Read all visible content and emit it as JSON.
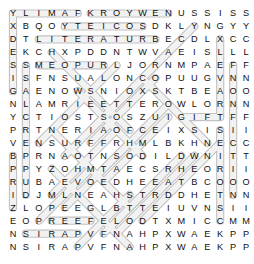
{
  "puzzle": {
    "type": "word-search",
    "rows": 19,
    "cols": 19,
    "cell_size": 12.95,
    "origin_x": 6.5,
    "origin_y": 7.0,
    "grid": [
      [
        "Y",
        "L",
        "I",
        "M",
        "A",
        "F",
        "K",
        "R",
        "O",
        "Y",
        "W",
        "E",
        "N",
        "U",
        "S",
        "S",
        "I",
        "S",
        "S"
      ],
      [
        "X",
        "B",
        "Q",
        "O",
        "Y",
        "T",
        "E",
        "I",
        "C",
        "O",
        "S",
        "D",
        "K",
        "L",
        "Y",
        "N",
        "G",
        "Y",
        "Y"
      ],
      [
        "D",
        "T",
        "L",
        "I",
        "T",
        "E",
        "R",
        "A",
        "T",
        "U",
        "R",
        "B",
        "E",
        "C",
        "D",
        "L",
        "X",
        "C",
        "C"
      ],
      [
        "E",
        "K",
        "C",
        "H",
        "X",
        "P",
        "D",
        "D",
        "N",
        "T",
        "W",
        "V",
        "A",
        "E",
        "I",
        "S",
        "L",
        "L",
        "L"
      ],
      [
        "S",
        "S",
        "M",
        "E",
        "O",
        "P",
        "U",
        "R",
        "L",
        "J",
        "O",
        "R",
        "N",
        "M",
        "P",
        "A",
        "E",
        "F",
        "F"
      ],
      [
        "I",
        "S",
        "F",
        "N",
        "S",
        "U",
        "A",
        "L",
        "O",
        "N",
        "C",
        "O",
        "P",
        "U",
        "U",
        "G",
        "V",
        "N",
        "N"
      ],
      [
        "G",
        "A",
        "E",
        "N",
        "O",
        "W",
        "S",
        "N",
        "I",
        "O",
        "X",
        "S",
        "K",
        "T",
        "B",
        "E",
        "A",
        "O",
        "O"
      ],
      [
        "N",
        "L",
        "A",
        "M",
        "R",
        "I",
        "E",
        "E",
        "T",
        "T",
        "E",
        "R",
        "O",
        "W",
        "L",
        "O",
        "R",
        "N",
        "N"
      ],
      [
        "Y",
        "C",
        "T",
        "I",
        "O",
        "S",
        "T",
        "S",
        "O",
        "S",
        "Z",
        "U",
        "I",
        "G",
        "I",
        "F",
        "T",
        "F",
        "F"
      ],
      [
        "P",
        "R",
        "T",
        "N",
        "E",
        "R",
        "I",
        "A",
        "O",
        "F",
        "C",
        "E",
        "I",
        "X",
        "S",
        "I",
        "S",
        "I",
        "I"
      ],
      [
        "V",
        "E",
        "N",
        "S",
        "U",
        "R",
        "F",
        "F",
        "R",
        "H",
        "M",
        "L",
        "B",
        "K",
        "H",
        "N",
        "E",
        "C",
        "C"
      ],
      [
        "B",
        "P",
        "R",
        "N",
        "A",
        "O",
        "T",
        "N",
        "S",
        "O",
        "D",
        "I",
        "L",
        "D",
        "W",
        "N",
        "I",
        "T",
        "T"
      ],
      [
        "P",
        "P",
        "Y",
        "Z",
        "O",
        "H",
        "M",
        "T",
        "A",
        "E",
        "C",
        "S",
        "R",
        "H",
        "E",
        "O",
        "R",
        "I",
        "I"
      ],
      [
        "R",
        "U",
        "B",
        "A",
        "E",
        "V",
        "O",
        "E",
        "D",
        "H",
        "E",
        "E",
        "A",
        "T",
        "B",
        "C",
        "O",
        "O",
        "O"
      ],
      [
        "I",
        "D",
        "J",
        "M",
        "L",
        "N",
        "E",
        "A",
        "H",
        "S",
        "T",
        "R",
        "D",
        "D",
        "H",
        "E",
        "T",
        "N",
        "N"
      ],
      [
        "Z",
        "L",
        "O",
        "P",
        "E",
        "E",
        "G",
        "L",
        "B",
        "T",
        "T",
        "E",
        "I",
        "U",
        "V",
        "N",
        "S",
        "I",
        "I"
      ],
      [
        "E",
        "O",
        "P",
        "R",
        "E",
        "E",
        "F",
        "E",
        "L",
        "O",
        "D",
        "T",
        "X",
        "M",
        "I",
        "C",
        "C",
        "M",
        "M"
      ],
      [
        "N",
        "S",
        "I",
        "R",
        "A",
        "P",
        "V",
        "F",
        "N",
        "A",
        "H",
        "P",
        "X",
        "W",
        "A",
        "E",
        "K",
        "P",
        "P"
      ],
      [
        "N",
        "S",
        "I",
        "R",
        "A",
        "P",
        "V",
        "F",
        "N",
        "A",
        "H",
        "P",
        "X",
        "W",
        "A",
        "E",
        "K",
        "P",
        "P"
      ]
    ],
    "found_words": [
      {
        "word": "FAMILY",
        "start": [
          0,
          5
        ],
        "end": [
          0,
          0
        ],
        "direction": "left"
      },
      {
        "word": "NEW YORK",
        "start": [
          0,
          12
        ],
        "end": [
          0,
          6
        ],
        "direction": "left"
      },
      {
        "word": "SOCIETY",
        "start": [
          1,
          10
        ],
        "end": [
          1,
          4
        ],
        "direction": "left"
      },
      {
        "word": "LITERATURE",
        "start": [
          2,
          2
        ],
        "end": [
          2,
          11
        ],
        "direction": "right"
      },
      {
        "word": "DESIGN",
        "start": [
          0,
          0
        ],
        "end": [
          6,
          0
        ],
        "direction": "down"
      },
      {
        "word": "PRIZE",
        "start": [
          11,
          0
        ],
        "end": [
          15,
          0
        ],
        "direction": "down"
      },
      {
        "word": "SUPERCLASS",
        "start": [
          14,
          1
        ],
        "end": [
          4,
          1
        ],
        "direction": "up"
      },
      {
        "word": "MUSEUM",
        "start": [
          4,
          2
        ],
        "end": [
          4,
          7
        ],
        "direction": "right"
      },
      {
        "word": "NONFICTION",
        "start": [
          4,
          17
        ],
        "end": [
          14,
          17
        ],
        "direction": "down"
      },
      {
        "word": "TRAVEL",
        "start": [
          8,
          16
        ],
        "end": [
          2,
          16
        ],
        "direction": "up"
      },
      {
        "word": "STORIES",
        "start": [
          9,
          16
        ],
        "end": [
          16,
          16
        ],
        "direction": "down"
      },
      {
        "word": "GIFT",
        "start": [
          8,
          13
        ],
        "end": [
          8,
          16
        ],
        "direction": "right"
      },
      {
        "word": "PARIS",
        "start": [
          17,
          5
        ],
        "end": [
          17,
          1
        ],
        "direction": "left"
      },
      {
        "word": "REEF",
        "start": [
          16,
          3
        ],
        "end": [
          16,
          6
        ],
        "direction": "right"
      },
      {
        "word": "EDITORS",
        "start": [
          3,
          3
        ],
        "end": [
          9,
          9
        ],
        "direction": "diagonal-down-right"
      },
      {
        "word": "AUTHORS",
        "start": [
          10,
          2
        ],
        "end": [
          4,
          8
        ],
        "direction": "diagonal-up-right"
      },
      {
        "word": "NOVELS",
        "start": [
          15,
          4
        ],
        "end": [
          10,
          9
        ],
        "direction": "diagonal-up-right"
      },
      {
        "word": "POETRY",
        "start": [
          6,
          5
        ],
        "end": [
          11,
          10
        ],
        "direction": "diagonal-down-right"
      },
      {
        "word": "READING",
        "start": [
          17,
          8
        ],
        "end": [
          11,
          14
        ],
        "direction": "diagonal-up-right"
      },
      {
        "word": "WRITERS",
        "start": [
          9,
          3
        ],
        "end": [
          15,
          9
        ],
        "direction": "diagonal-down-right"
      },
      {
        "word": "CLASSIC",
        "start": [
          13,
          6
        ],
        "end": [
          7,
          12
        ],
        "direction": "diagonal-up-right"
      },
      {
        "word": "ESSAYS",
        "start": [
          5,
          10
        ],
        "end": [
          10,
          15
        ],
        "direction": "diagonal-down-right"
      },
      {
        "word": "COOKING",
        "start": [
          16,
          10
        ],
        "end": [
          10,
          16
        ],
        "direction": "diagonal-up-right"
      },
      {
        "word": "HISTORY",
        "start": [
          12,
          3
        ],
        "end": [
          18,
          9
        ],
        "direction": "diagonal-down-right"
      },
      {
        "word": "FICTION",
        "start": [
          2,
          13
        ],
        "end": [
          8,
          7
        ],
        "direction": "diagonal-down-left"
      },
      {
        "word": "LETTERS",
        "start": [
          1,
          14
        ],
        "end": [
          7,
          8
        ],
        "direction": "diagonal-down-left"
      },
      {
        "word": "MEMOIR",
        "start": [
          3,
          12
        ],
        "end": [
          9,
          6
        ],
        "direction": "diagonal-down-left"
      },
      {
        "word": "NOTES",
        "start": [
          5,
          11
        ],
        "end": [
          10,
          6
        ],
        "direction": "diagonal-down-left"
      },
      {
        "word": "PAGES",
        "start": [
          8,
          12
        ],
        "end": [
          13,
          7
        ],
        "direction": "diagonal-down-left"
      },
      {
        "word": "BOOKS",
        "start": [
          11,
          13
        ],
        "end": [
          16,
          8
        ],
        "direction": "diagonal-down-left"
      },
      {
        "word": "NEWS",
        "start": [
          13,
          11
        ],
        "end": [
          17,
          7
        ],
        "direction": "diagonal-down-left"
      },
      {
        "word": "PRESS",
        "start": [
          9,
          8
        ],
        "end": [
          14,
          3
        ],
        "direction": "diagonal-down-left"
      },
      {
        "word": "DRAMA",
        "start": [
          12,
          6
        ],
        "end": [
          16,
          2
        ],
        "direction": "diagonal-down-left"
      },
      {
        "word": "VERSE",
        "start": [
          14,
          9
        ],
        "end": [
          18,
          5
        ],
        "direction": "diagonal-down-left"
      },
      {
        "word": "TITLES",
        "start": [
          6,
          9
        ],
        "end": [
          11,
          4
        ],
        "direction": "diagonal-down-left"
      }
    ]
  },
  "colors": {
    "highlight_stroke": "#bdbdbd",
    "highlight_fill": "#f2f2f2",
    "letter": "#101010",
    "background": "#ffffff"
  }
}
